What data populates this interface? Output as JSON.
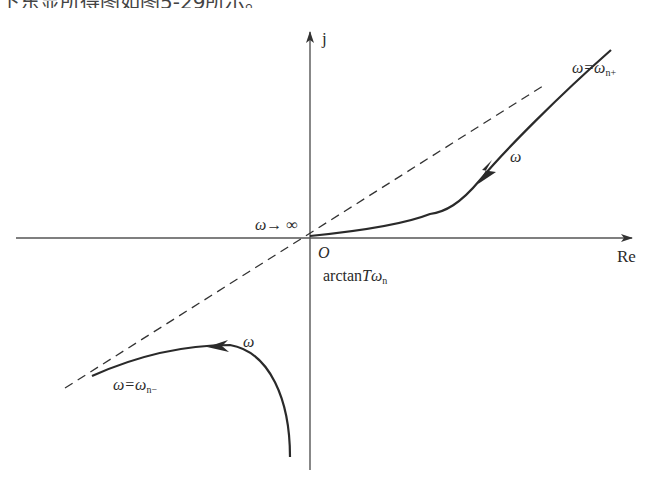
{
  "caption_fragment": "下东显所得图如图5-29所示。",
  "axes": {
    "imag_label": "j",
    "real_label": "Re",
    "origin_label": "O"
  },
  "labels": {
    "omega_inf": "ω→ ∞",
    "angle": "arctan",
    "angle_T": "T",
    "angle_omega": "ω",
    "angle_sub": "n",
    "omega_n_plus": "ω=ω",
    "omega_n_plus_sub": "n+",
    "omega_n_minus": "ω=ω",
    "omega_n_minus_sub": "n−",
    "omega_upper": "ω",
    "omega_lower": "ω"
  },
  "colors": {
    "stroke": "#2a2a2a",
    "axis": "#555555"
  }
}
